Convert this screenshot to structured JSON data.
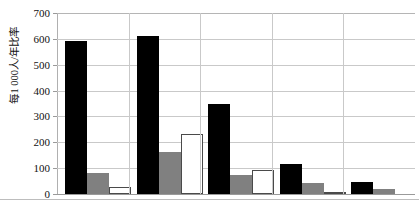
{
  "axis": {
    "y_title": "每1 000人/年比率",
    "tick_labels": [
      "700",
      "600",
      "500",
      "400",
      "300",
      "200",
      "100",
      "0"
    ]
  },
  "chart_data": {
    "type": "bar",
    "title": "",
    "subtitle": "",
    "xlabel": "",
    "ylabel": "每1 000人/年比率",
    "ylim": [
      0,
      700
    ],
    "ytick_step": 100,
    "yticks": [
      0,
      100,
      200,
      300,
      400,
      500,
      600,
      700
    ],
    "grid": true,
    "grid_axis": "y",
    "legend": false,
    "legend_position": "none",
    "categories": [
      "1",
      "2",
      "3",
      "4",
      "5"
    ],
    "category_labels_visible": false,
    "series": [
      {
        "name": "Series 1",
        "color": "#000000",
        "style": "solid-black",
        "values": [
          590,
          612,
          348,
          117,
          47
        ]
      },
      {
        "name": "Series 2",
        "color": "#808080",
        "style": "solid-gray",
        "values": [
          80,
          163,
          75,
          41,
          20
        ]
      },
      {
        "name": "Series 3",
        "color": "#ffffff",
        "style": "outlined-white",
        "values": [
          28,
          232,
          93,
          7,
          0
        ]
      }
    ]
  },
  "colors": {
    "series_black": "#000000",
    "series_gray": "#808080",
    "series_white": "#ffffff",
    "outline": "#4a4a4a",
    "gridline": "#c9c9c9",
    "background": "#ffffff"
  }
}
